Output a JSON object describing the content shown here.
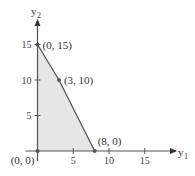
{
  "chart_data": {
    "type": "area",
    "title": "",
    "xlabel": "y1",
    "ylabel": "y2",
    "xlabel_main": "y",
    "xlabel_sub": "1",
    "ylabel_main": "y",
    "ylabel_sub": "2",
    "xlim": [
      0,
      17
    ],
    "ylim": [
      0,
      18
    ],
    "x_ticks": [
      5,
      10,
      15
    ],
    "y_ticks": [
      5,
      10,
      15
    ],
    "x_tick_labels": [
      "5",
      "10",
      "15"
    ],
    "y_tick_labels": [
      "5",
      "10",
      "15"
    ],
    "grid": false,
    "feasible_region": {
      "vertices": [
        [
          0,
          0
        ],
        [
          0,
          15
        ],
        [
          3,
          10
        ],
        [
          8,
          0
        ]
      ],
      "fill": "#e6e6e6"
    },
    "points": [
      {
        "x": 0,
        "y": 15,
        "label": "(0, 15)"
      },
      {
        "x": 3,
        "y": 10,
        "label": "(3, 10)"
      },
      {
        "x": 8,
        "y": 0,
        "label": "(8, 0)"
      },
      {
        "x": 0,
        "y": 0,
        "label": "(0, 0)"
      }
    ]
  },
  "colors": {
    "axis": "#555555",
    "boundary": "#555555",
    "fill": "#e6e6e6",
    "text": "#333333"
  }
}
